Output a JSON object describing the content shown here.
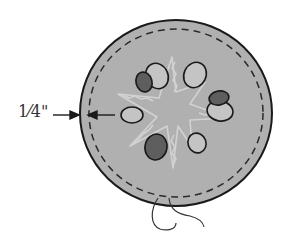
{
  "diagram": {
    "measurement_label": "1⁄4\"",
    "colors": {
      "fabric": "#b0b0b0",
      "outline": "#1a1a1a",
      "stitch": "#2a2a2a",
      "motif_light": "#c4c4c4",
      "motif_dark": "#5e5e5e",
      "star": "#cfcfcf",
      "thread": "#333333"
    }
  }
}
